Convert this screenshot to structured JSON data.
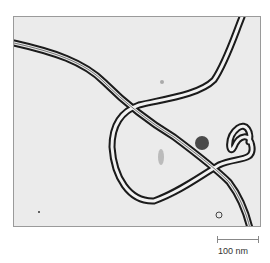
{
  "figure": {
    "scale_bar": {
      "label": "100 nm"
    }
  }
}
